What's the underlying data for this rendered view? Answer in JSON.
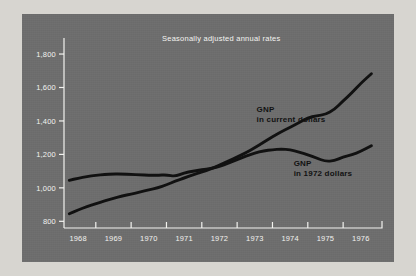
{
  "chart_data": {
    "type": "line",
    "title": "Seasonally adjusted annual rates",
    "xlabel": "",
    "ylabel": "",
    "xlim": [
      1967.6,
      1976.6
    ],
    "ylim": [
      760,
      1860
    ],
    "yticks": [
      800,
      1000,
      1200,
      1400,
      1600,
      1800
    ],
    "ytick_labels": [
      "800",
      "1,000",
      "1,200",
      "1,400",
      "1,600",
      "1,800"
    ],
    "xticks": [
      1968,
      1969,
      1970,
      1971,
      1972,
      1973,
      1974,
      1975,
      1976
    ],
    "xtick_labels": [
      "1968",
      "1969",
      "1970",
      "1971",
      "1972",
      "1973",
      "1974",
      "1975",
      "1976"
    ],
    "grid": false,
    "legend_position": "inline-annotations",
    "annotations": [
      {
        "name": "gnp-current-dollars",
        "line1": "GNP",
        "line2": "in current dollars"
      },
      {
        "name": "gnp-1972-dollars",
        "line1": "GNP",
        "line2": "in 1972 dollars"
      }
    ],
    "series": [
      {
        "name": "GNP in current dollars",
        "color": "#111111",
        "x": [
          1967.75,
          1968.0,
          1968.25,
          1968.5,
          1968.75,
          1969.0,
          1969.25,
          1969.5,
          1969.75,
          1970.0,
          1970.25,
          1970.5,
          1970.75,
          1971.0,
          1971.25,
          1971.5,
          1971.75,
          1972.0,
          1972.25,
          1972.5,
          1972.75,
          1973.0,
          1973.25,
          1973.5,
          1973.75,
          1974.0,
          1974.25,
          1974.5,
          1974.75,
          1975.0,
          1975.25,
          1975.5,
          1975.75,
          1976.0,
          1976.3
        ],
        "values": [
          845,
          868,
          888,
          905,
          922,
          938,
          952,
          962,
          975,
          988,
          1000,
          1018,
          1040,
          1058,
          1078,
          1095,
          1112,
          1135,
          1160,
          1185,
          1210,
          1240,
          1272,
          1305,
          1335,
          1362,
          1390,
          1418,
          1432,
          1438,
          1468,
          1520,
          1568,
          1625,
          1682
        ]
      },
      {
        "name": "GNP in 1972 dollars",
        "color": "#111111",
        "x": [
          1967.75,
          1968.0,
          1968.25,
          1968.5,
          1968.75,
          1969.0,
          1969.25,
          1969.5,
          1969.75,
          1970.0,
          1970.25,
          1970.5,
          1970.75,
          1971.0,
          1971.25,
          1971.5,
          1971.75,
          1972.0,
          1972.25,
          1972.5,
          1972.75,
          1973.0,
          1973.25,
          1973.5,
          1973.75,
          1974.0,
          1974.25,
          1974.5,
          1974.75,
          1975.0,
          1975.25,
          1975.5,
          1975.75,
          1976.0,
          1976.3
        ],
        "values": [
          1045,
          1058,
          1068,
          1075,
          1080,
          1083,
          1082,
          1080,
          1078,
          1076,
          1075,
          1078,
          1068,
          1090,
          1100,
          1108,
          1115,
          1128,
          1148,
          1168,
          1190,
          1208,
          1222,
          1228,
          1232,
          1228,
          1215,
          1198,
          1178,
          1158,
          1162,
          1185,
          1198,
          1218,
          1252
        ]
      }
    ]
  },
  "style": {
    "panel_color": "#6e6e6e",
    "page_color": "#d7d5d0",
    "axis_color": "#f2f2ef",
    "line_color": "#111111"
  }
}
